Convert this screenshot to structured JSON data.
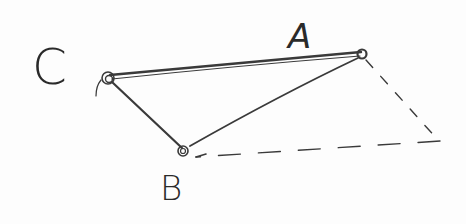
{
  "diagram": {
    "type": "hand-drawn triangle sketch",
    "points": [
      {
        "id": "A",
        "label": "A",
        "x": 362,
        "y": 54
      },
      {
        "id": "B",
        "label": "B",
        "x": 183,
        "y": 151
      },
      {
        "id": "C",
        "label": "C",
        "x": 108,
        "y": 77
      }
    ],
    "edges": [
      {
        "from": "C",
        "to": "A",
        "style": "solid"
      },
      {
        "from": "C",
        "to": "B",
        "style": "solid"
      },
      {
        "from": "B",
        "to": "A",
        "style": "solid"
      },
      {
        "from": "A",
        "to": "D",
        "style": "dashed"
      },
      {
        "from": "D",
        "to": "B",
        "style": "dashed",
        "arrow": "B"
      }
    ],
    "helper_point": {
      "id": "D",
      "x": 440,
      "y": 141
    },
    "labels": {
      "a": "A",
      "b": "B",
      "c": "C"
    }
  }
}
